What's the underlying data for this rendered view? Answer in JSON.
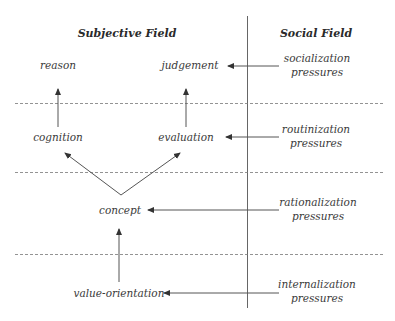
{
  "headings": {
    "subjective": "Subjective Field",
    "social": "Social Field"
  },
  "nodes": {
    "reason": "reason",
    "judgement": "judgement",
    "cognition": "cognition",
    "evaluation": "evaluation",
    "concept": "concept",
    "value_orientation": "value-orientation"
  },
  "pressures": [
    {
      "line1": "socialization",
      "line2": "pressures",
      "target": "judgement"
    },
    {
      "line1": "routinization",
      "line2": "pressures",
      "target": "evaluation"
    },
    {
      "line1": "rationalization",
      "line2": "pressures",
      "target": "concept"
    },
    {
      "line1": "internalization",
      "line2": "pressures",
      "target": "value-orientation"
    }
  ],
  "edges": [
    {
      "from": "cognition",
      "to": "reason"
    },
    {
      "from": "evaluation",
      "to": "judgement"
    },
    {
      "from": "concept",
      "to": "cognition"
    },
    {
      "from": "concept",
      "to": "evaluation"
    },
    {
      "from": "value-orientation",
      "to": "concept"
    }
  ],
  "colors": {
    "line": "#555555",
    "dashed": "#777777",
    "text": "#3a3a3a"
  }
}
